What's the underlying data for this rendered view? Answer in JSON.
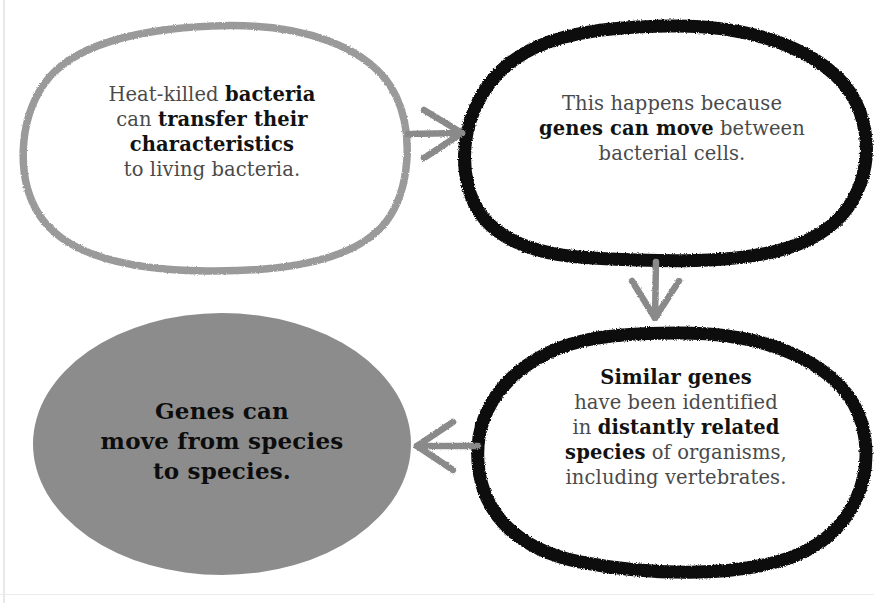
{
  "diagram": {
    "type": "flow-diagram",
    "canvas": {
      "width": 874,
      "height": 603
    },
    "background_color": "#ffffff",
    "palette": {
      "gray_outline": "#9a9a9a",
      "black_outline": "#111111",
      "gray_fill": "#8c8c8c",
      "arrow_gray": "#8a8a8a",
      "body_text": "#4a4a4a",
      "bold_text": "#121212"
    }
  },
  "nodes": [
    {
      "id": "heat-killed-bacteria",
      "position": "top-left",
      "shape": "hand-drawn-rounded-blob",
      "outline_color": "#9a9a9a",
      "fill_color": "#ffffff",
      "lines": [
        [
          {
            "text": "Heat-killed ",
            "bold": false
          },
          {
            "text": "bacteria",
            "bold": true
          }
        ],
        [
          {
            "text": "can ",
            "bold": false
          },
          {
            "text": "transfer their",
            "bold": true
          }
        ],
        [
          {
            "text": "characteristics",
            "bold": true
          }
        ],
        [
          {
            "text": "to living bacteria.",
            "bold": false
          }
        ]
      ],
      "plain_text": "Heat-killed bacteria can transfer their characteristics to living bacteria."
    },
    {
      "id": "genes-can-move",
      "position": "top-right",
      "shape": "hand-drawn-oval",
      "outline_color": "#111111",
      "fill_color": "#ffffff",
      "lines": [
        [
          {
            "text": "This happens because",
            "bold": false
          }
        ],
        [
          {
            "text": "genes can move",
            "bold": true
          },
          {
            "text": " between",
            "bold": false
          }
        ],
        [
          {
            "text": "bacterial cells.",
            "bold": false
          }
        ]
      ],
      "plain_text": "This happens because genes can move between bacterial cells."
    },
    {
      "id": "similar-genes",
      "position": "bottom-right",
      "shape": "hand-drawn-oval",
      "outline_color": "#111111",
      "fill_color": "#ffffff",
      "lines": [
        [
          {
            "text": "Similar genes",
            "bold": true
          }
        ],
        [
          {
            "text": "have been identified",
            "bold": false
          }
        ],
        [
          {
            "text": "in ",
            "bold": false
          },
          {
            "text": "distantly related",
            "bold": true
          }
        ],
        [
          {
            "text": "species",
            "bold": true
          },
          {
            "text": " of organisms,",
            "bold": false
          }
        ],
        [
          {
            "text": "including vertebrates.",
            "bold": false
          }
        ]
      ],
      "plain_text": "Similar genes have been identified in distantly related species of organisms, including vertebrates."
    },
    {
      "id": "conclusion",
      "position": "bottom-left",
      "shape": "filled-ellipse",
      "outline_color": "none",
      "fill_color": "#8c8c8c",
      "lines": [
        [
          {
            "text": "Genes can",
            "bold": true
          }
        ],
        [
          {
            "text": "move from species",
            "bold": true
          }
        ],
        [
          {
            "text": "to species.",
            "bold": true
          }
        ]
      ],
      "plain_text": "Genes can move from species to species."
    }
  ],
  "arrows": [
    {
      "id": "arrow-right",
      "from": "heat-killed-bacteria",
      "to": "genes-can-move",
      "direction": "right",
      "color": "#8a8a8a",
      "style": "hand-drawn"
    },
    {
      "id": "arrow-down",
      "from": "genes-can-move",
      "to": "similar-genes",
      "direction": "down",
      "color": "#8a8a8a",
      "style": "hand-drawn"
    },
    {
      "id": "arrow-left",
      "from": "similar-genes",
      "to": "conclusion",
      "direction": "left",
      "color": "#8a8a8a",
      "style": "hand-drawn"
    }
  ]
}
